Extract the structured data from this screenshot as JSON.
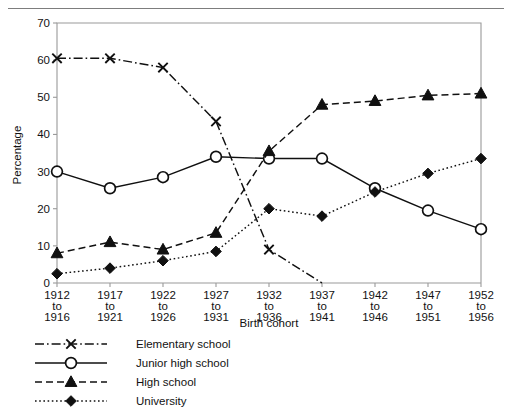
{
  "figure": {
    "cropped_header_text": "",
    "axis_color": "#9a9a9a",
    "ink_color": "#101010"
  },
  "chart_data": {
    "type": "line",
    "title": "",
    "xlabel": "Birth cohort",
    "ylabel": "Percentage",
    "ylim": [
      0,
      70
    ],
    "yticks": [
      0,
      10,
      20,
      30,
      40,
      50,
      60,
      70
    ],
    "grid": false,
    "legend_position": "below-left",
    "categories": [
      "1912\nto\n1916",
      "1917\nto\n1921",
      "1922\nto\n1926",
      "1927\nto\n1931",
      "1932\nto\n1936",
      "1937\nto\n1941",
      "1942\nto\n1946",
      "1947\nto\n1951",
      "1952\nto\n1956"
    ],
    "category_lines": [
      [
        "1912",
        "to",
        "1916"
      ],
      [
        "1917",
        "to",
        "1921"
      ],
      [
        "1922",
        "to",
        "1926"
      ],
      [
        "1927",
        "to",
        "1931"
      ],
      [
        "1932",
        "to",
        "1936"
      ],
      [
        "1937",
        "to",
        "1941"
      ],
      [
        "1942",
        "to",
        "1946"
      ],
      [
        "1947",
        "to",
        "1951"
      ],
      [
        "1952",
        "to",
        "1956"
      ]
    ],
    "series": [
      {
        "name": "Elementary school",
        "marker": "x",
        "linestyle": "dashdot",
        "values": [
          60.5,
          60.5,
          58.0,
          43.5,
          9.0,
          0.0,
          null,
          null,
          null
        ]
      },
      {
        "name": "Junior high school",
        "marker": "open-circle",
        "linestyle": "solid",
        "values": [
          30.0,
          25.5,
          28.5,
          34.0,
          33.5,
          33.5,
          25.5,
          19.5,
          14.5
        ]
      },
      {
        "name": "High school",
        "marker": "filled-triangle",
        "linestyle": "dashed",
        "values": [
          8.0,
          11.0,
          9.0,
          13.5,
          35.5,
          48.0,
          49.0,
          50.5,
          51.0
        ]
      },
      {
        "name": "University",
        "marker": "filled-diamond",
        "linestyle": "dotted",
        "values": [
          2.5,
          4.0,
          6.0,
          8.5,
          20.0,
          18.0,
          24.5,
          29.5,
          33.5
        ]
      }
    ]
  },
  "legend": {
    "entries": [
      {
        "label": "Elementary school",
        "marker": "x",
        "linestyle": "dashdot"
      },
      {
        "label": "Junior high school",
        "marker": "open-circle",
        "linestyle": "solid"
      },
      {
        "label": "High school",
        "marker": "filled-triangle",
        "linestyle": "dashed"
      },
      {
        "label": "University",
        "marker": "filled-diamond",
        "linestyle": "dotted"
      }
    ]
  }
}
